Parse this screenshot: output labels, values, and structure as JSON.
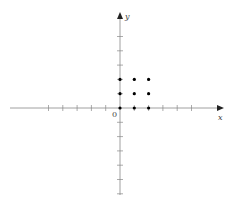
{
  "diagram": {
    "x_label": "x",
    "y_label": "y",
    "origin_label": "0",
    "origin_px": [
      120,
      108
    ],
    "unit_px": 14.3,
    "x_ticks": [
      -5,
      -4,
      -3,
      -2,
      -1,
      1,
      2,
      3,
      4,
      5
    ],
    "y_ticks": [
      -6,
      -5,
      -4,
      -3,
      -2,
      -1,
      1,
      2,
      3,
      4,
      5
    ],
    "points": [
      [
        0,
        0
      ],
      [
        0,
        1
      ],
      [
        0,
        2
      ],
      [
        1,
        0
      ],
      [
        1,
        1
      ],
      [
        1,
        2
      ],
      [
        2,
        0
      ],
      [
        2,
        1
      ],
      [
        2,
        2
      ]
    ],
    "axis_color": "#888888",
    "point_color": "#000000"
  }
}
